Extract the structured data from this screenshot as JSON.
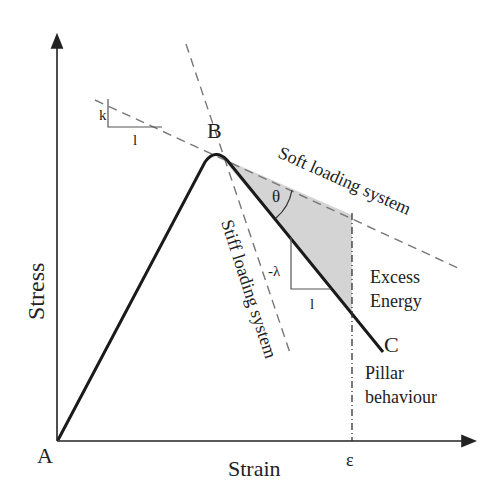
{
  "diagram": {
    "axes": {
      "x_label": "Strain",
      "y_label": "Stress"
    },
    "points": {
      "A": "A",
      "B": "B",
      "C": "C"
    },
    "labels": {
      "soft": "Soft loading system",
      "stiff": "Stiff loading system",
      "k": "k",
      "k_run": "l",
      "lambda": "-λ",
      "lambda_run": "l",
      "theta": "θ",
      "excess_line1": "Excess",
      "excess_line2": "Energy",
      "pillar_line1": "Pillar",
      "pillar_line2": "behaviour",
      "epsilon": "ε"
    },
    "colors": {
      "curve": "#1a1a1a",
      "dashed": "#777777",
      "shade": "#d4d4d4"
    }
  }
}
